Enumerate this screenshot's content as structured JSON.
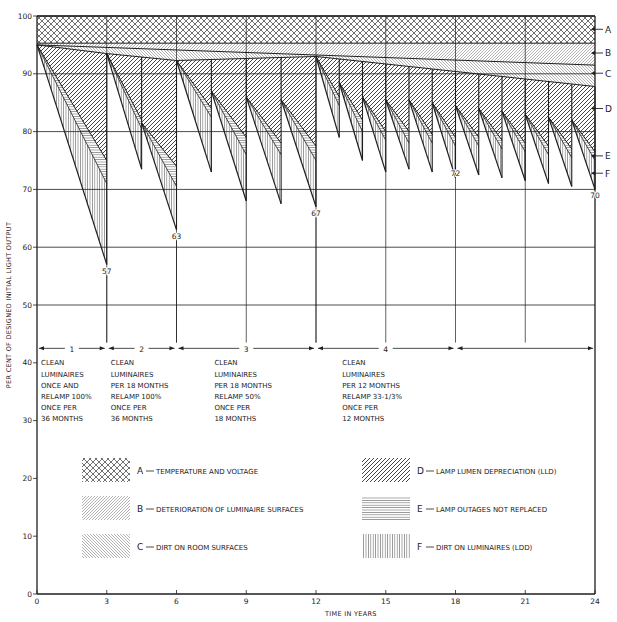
{
  "chart_data": {
    "type": "area",
    "title": "",
    "xlabel": "TIME IN YEARS",
    "ylabel": "PER CENT OF DESIGNED INITIAL LIGHT OUTPUT",
    "xlim": [
      0,
      24
    ],
    "ylim": [
      0,
      100
    ],
    "x_ticks": [
      0,
      3,
      6,
      9,
      12,
      15,
      18,
      21,
      24
    ],
    "y_ticks": [
      0,
      10,
      20,
      30,
      40,
      50,
      60,
      70,
      80,
      90,
      100
    ],
    "grid": true,
    "grid_y_from": 50,
    "bands": {
      "A_bottom": [
        [
          0,
          95.3
        ],
        [
          24,
          95.3
        ]
      ],
      "B_bottom": [
        [
          0,
          95
        ],
        [
          24,
          91.5
        ]
      ],
      "C_bottom": [
        [
          0,
          95
        ],
        [
          3,
          93.5
        ],
        [
          6,
          92.3
        ],
        [
          12,
          93
        ],
        [
          24,
          87.8
        ]
      ]
    },
    "cycles": [
      {
        "start": 0,
        "end": 3,
        "top": 95,
        "d": 75,
        "e": 71,
        "f": 57
      },
      {
        "start": 3,
        "end": 4.5,
        "top": 93.5,
        "d": 82,
        "e": 80.5,
        "f": 73.5
      },
      {
        "start": 4.5,
        "end": 6,
        "top": 81.5,
        "d": 74,
        "e": 70.5,
        "f": 63
      },
      {
        "start": 6,
        "end": 7.5,
        "top": 92.3,
        "d": 84,
        "e": 82.5,
        "f": 73
      },
      {
        "start": 7.5,
        "end": 9,
        "top": 87,
        "d": 79,
        "e": 76,
        "f": 68
      },
      {
        "start": 9,
        "end": 10.5,
        "top": 86,
        "d": 78,
        "e": 76,
        "f": 67.5
      },
      {
        "start": 10.5,
        "end": 12,
        "top": 85.5,
        "d": 77.5,
        "e": 75,
        "f": 67
      },
      {
        "start": 12,
        "end": 13,
        "top": 93,
        "d": 86,
        "e": 84.5,
        "f": 79
      },
      {
        "start": 13,
        "end": 14,
        "top": 88.5,
        "d": 82,
        "e": 80,
        "f": 75
      },
      {
        "start": 14,
        "end": 15,
        "top": 86,
        "d": 80,
        "e": 78.5,
        "f": 73
      },
      {
        "start": 15,
        "end": 16,
        "top": 85.5,
        "d": 80,
        "e": 78,
        "f": 73.5
      },
      {
        "start": 16,
        "end": 17,
        "top": 85.5,
        "d": 79.5,
        "e": 78,
        "f": 73
      },
      {
        "start": 17,
        "end": 18,
        "top": 85,
        "d": 79,
        "e": 77.5,
        "f": 72
      },
      {
        "start": 18,
        "end": 19,
        "top": 84.5,
        "d": 79,
        "e": 77.5,
        "f": 72.5
      },
      {
        "start": 19,
        "end": 20,
        "top": 84,
        "d": 78.5,
        "e": 77,
        "f": 72
      },
      {
        "start": 20,
        "end": 21,
        "top": 83.5,
        "d": 78,
        "e": 76.5,
        "f": 71.5
      },
      {
        "start": 21,
        "end": 22,
        "top": 83,
        "d": 77.5,
        "e": 76,
        "f": 71
      },
      {
        "start": 22,
        "end": 23,
        "top": 82.5,
        "d": 77,
        "e": 75.5,
        "f": 70.5
      },
      {
        "start": 23,
        "end": 24,
        "top": 82,
        "d": 76.5,
        "e": 75,
        "f": 70
      }
    ],
    "value_labels": [
      {
        "x": 3,
        "y": 57,
        "text": "57"
      },
      {
        "x": 6,
        "y": 63,
        "text": "63"
      },
      {
        "x": 12,
        "y": 67,
        "text": "67"
      },
      {
        "x": 18,
        "y": 72,
        "text": "72"
      },
      {
        "x": 24,
        "y": 70,
        "text": "70"
      }
    ],
    "right_markers": [
      {
        "label": "A",
        "y": 97.7
      },
      {
        "label": "B",
        "y": 93.6
      },
      {
        "label": "C",
        "y": 90.1
      },
      {
        "label": "D",
        "y": 84
      },
      {
        "label": "E",
        "y": 75.8
      },
      {
        "label": "F",
        "y": 72.8
      }
    ],
    "periods": [
      {
        "num": "1",
        "from": 0,
        "to": 3,
        "lines": [
          "CLEAN",
          "LUMINAIRES",
          "ONCE AND",
          "RELAMP 100%",
          "ONCE PER",
          "36 MONTHS"
        ]
      },
      {
        "num": "2",
        "from": 3,
        "to": 6,
        "lines": [
          "CLEAN",
          "LUMINAIRES",
          "PER 18 MONTHS",
          "RELAMP 100%",
          "ONCE PER",
          "36 MONTHS"
        ]
      },
      {
        "num": "3",
        "from": 6,
        "to": 12,
        "lines": [
          "CLEAN",
          "LUMINAIRES",
          "PER 18 MONTHS",
          "RELAMP 50%",
          "ONCE PER",
          "18 MONTHS"
        ]
      },
      {
        "num": "4",
        "from": 12,
        "to": 18,
        "lines": [
          "CLEAN",
          "LUMINAIRES",
          "PER 12 MONTHS",
          "RELAMP 33-1/3%",
          "ONCE PER",
          "12 MONTHS"
        ]
      },
      {
        "num": "",
        "from": 18,
        "to": 24,
        "lines": []
      }
    ],
    "legend": [
      {
        "key": "A",
        "label": "TEMPERATURE AND VOLTAGE",
        "pattern": "crosshatch"
      },
      {
        "key": "B",
        "label": "DETERIORATION OF LUMINAIRE SURFACES",
        "pattern": "diag-fine"
      },
      {
        "key": "C",
        "label": "DIRT ON ROOM SURFACES",
        "pattern": "backdiag-fine"
      },
      {
        "key": "D",
        "label": "LAMP LUMEN DEPRECIATION (LLD)",
        "pattern": "diag-bold"
      },
      {
        "key": "E",
        "label": "LAMP OUTAGES NOT REPLACED",
        "pattern": "horizontal"
      },
      {
        "key": "F",
        "label": "DIRT ON LUMINAIRES (LDD)",
        "pattern": "vertical"
      }
    ]
  },
  "layout": {
    "x0": 37,
    "x1": 595,
    "y100": 16,
    "y0": 594,
    "ink": "#1e1e1e"
  }
}
